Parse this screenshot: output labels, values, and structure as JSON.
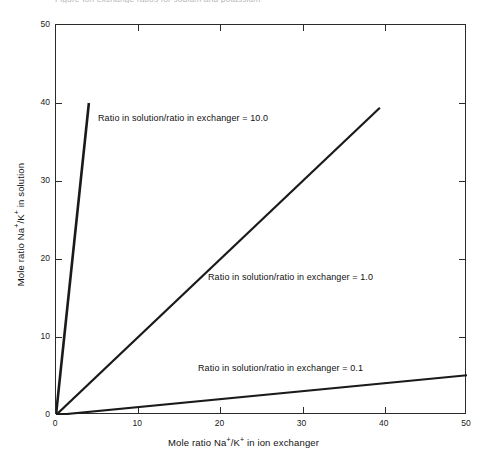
{
  "figure": {
    "top_caption_fragment": "Figure   Ion exchange ratios for sodium and potassium"
  },
  "chart_data": {
    "type": "line",
    "title": "",
    "xlabel": "Mole ratio Na+/K+ in ion exchanger",
    "ylabel": "Mole ratio Na+/K+ in solution",
    "xlim": [
      0,
      50
    ],
    "ylim": [
      0,
      50
    ],
    "xticks": [
      0,
      10,
      20,
      30,
      40,
      50
    ],
    "yticks": [
      0,
      10,
      20,
      30,
      40,
      50
    ],
    "grid": false,
    "legend": "none (inline annotations)",
    "series": [
      {
        "name": "Ratio in solution/ratio in exchanger = 10.0",
        "slope": 10.0,
        "x": [
          0,
          4.0
        ],
        "y": [
          0,
          40.0
        ]
      },
      {
        "name": "Ratio in solution/ratio in exchanger = 1.0",
        "slope": 1.0,
        "x": [
          0,
          39.4
        ],
        "y": [
          0,
          39.4
        ]
      },
      {
        "name": "Ratio in solution/ratio in exchanger = 0.1",
        "slope": 0.1,
        "x": [
          0,
          50.0
        ],
        "y": [
          0,
          5.1
        ]
      }
    ],
    "annotations": [
      {
        "text": "Ratio in solution/ratio in exchanger = 10.0",
        "x": 5.2,
        "y": 38.0
      },
      {
        "text": "Ratio in solution/ratio in exchanger = 1.0",
        "x": 18.7,
        "y": 17.8
      },
      {
        "text": "Ratio in solution/ratio in exchanger = 0.1",
        "x": 17.4,
        "y": 6.5
      }
    ]
  },
  "axes": {
    "x_tick_labels": [
      "0",
      "10",
      "20",
      "30",
      "40",
      "50"
    ],
    "y_tick_labels": [
      "0",
      "10",
      "20",
      "30",
      "40",
      "50"
    ],
    "x_title_prefix": "Mole ratio Na",
    "x_title_mid": "/K",
    "x_title_suffix": " in ion exchanger",
    "y_title_prefix": "Mole ratio Na",
    "y_title_mid": "/K",
    "y_title_suffix": " in solution",
    "superscript": "+"
  },
  "colors": {
    "line": "#1a1a1a",
    "frame": "#2b2b2b",
    "background": "#ffffff"
  }
}
